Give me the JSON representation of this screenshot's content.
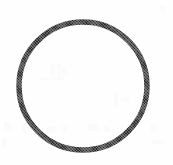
{
  "figure": {
    "kind": "scanned-line-illustration",
    "alt_text": "Circle outline",
    "caption": "",
    "label": "",
    "background_color": "#fefefe",
    "stroke_color": "#2b2b2b",
    "ghost_color": "#fafafa",
    "canvas": {
      "width": 173,
      "height": 165
    },
    "geometry": {
      "shape": "circle",
      "center_x": 83,
      "center_y": 86,
      "radius": 64,
      "stroke_width": 5.5,
      "fill": "none",
      "bounds": {
        "left": 16,
        "top": 19,
        "right": 150,
        "bottom": 154
      }
    },
    "texture": {
      "type": "halftone-dither",
      "note": "fine printed-halftone grain visible along the stroke"
    },
    "ghost_marks": [
      {
        "x": 4,
        "y": 122,
        "w": 7,
        "h": 9
      },
      {
        "x": 22,
        "y": 124,
        "w": 4,
        "h": 8
      },
      {
        "x": 46,
        "y": 126,
        "w": 9,
        "h": 7
      },
      {
        "x": 62,
        "y": 125,
        "w": 5,
        "h": 8
      },
      {
        "x": 88,
        "y": 124,
        "w": 11,
        "h": 7
      },
      {
        "x": 104,
        "y": 126,
        "w": 6,
        "h": 6
      },
      {
        "x": 126,
        "y": 125,
        "w": 8,
        "h": 7
      },
      {
        "x": 150,
        "y": 124,
        "w": 6,
        "h": 8
      },
      {
        "x": 50,
        "y": 64,
        "w": 5,
        "h": 12
      },
      {
        "x": 57,
        "y": 63,
        "w": 4,
        "h": 13
      },
      {
        "x": 62,
        "y": 66,
        "w": 4,
        "h": 9
      },
      {
        "x": 40,
        "y": 77,
        "w": 24,
        "h": 3
      },
      {
        "x": 114,
        "y": 92,
        "w": 4,
        "h": 14
      },
      {
        "x": 121,
        "y": 97,
        "w": 8,
        "h": 5
      },
      {
        "x": 160,
        "y": 6,
        "w": 5,
        "h": 7
      },
      {
        "x": 2,
        "y": 138,
        "w": 5,
        "h": 10
      },
      {
        "x": 152,
        "y": 140,
        "w": 12,
        "h": 4
      }
    ]
  }
}
